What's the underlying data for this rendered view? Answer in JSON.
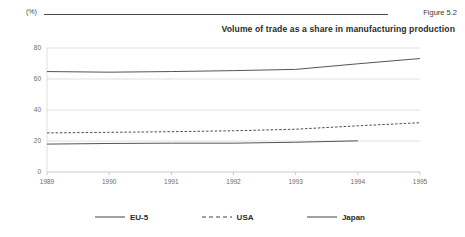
{
  "header": {
    "unit_label": "(%)",
    "figure_number": "Figure 5.2"
  },
  "chart_data": {
    "type": "line",
    "title": "Volume of trade as a share in manufacturing production",
    "xlabel": "",
    "ylabel": "(%)",
    "x": [
      1989,
      1990,
      1991,
      1992,
      1993,
      1994,
      1995
    ],
    "categories": [
      "1989",
      "1990",
      "1991",
      "1992",
      "1993",
      "1994",
      "1995"
    ],
    "ylim": [
      0,
      80
    ],
    "yticks": [
      0,
      20,
      40,
      60,
      80
    ],
    "ytick_labels": [
      "0",
      "20",
      "40",
      "60",
      "80"
    ],
    "grid": true,
    "legend_position": "bottom",
    "series": [
      {
        "name": "EU-5",
        "style": "solid",
        "color": "#555555",
        "values": [
          18,
          18.4,
          18.6,
          18.6,
          19.2,
          20.1,
          null
        ]
      },
      {
        "name": "USA",
        "style": "dashed",
        "color": "#4d4d4d",
        "values": [
          25.2,
          25.6,
          26.0,
          26.6,
          27.6,
          29.8,
          31.8
        ]
      },
      {
        "name": "Japan",
        "style": "solid",
        "color": "#555555",
        "values": [
          64.8,
          64.4,
          64.8,
          65.4,
          66.2,
          69.8,
          73.2
        ]
      }
    ]
  },
  "legend": {
    "items": [
      {
        "label": "EU-5",
        "style": "solid"
      },
      {
        "label": "USA",
        "style": "dashed"
      },
      {
        "label": "Japan",
        "style": "solid"
      }
    ]
  }
}
